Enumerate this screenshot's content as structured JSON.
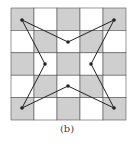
{
  "figure": {
    "caption": "(b)",
    "grid": {
      "rows": 5,
      "cols": 5,
      "x0": 11,
      "y0": 8,
      "cell_w": 23,
      "cell_h": 22.4,
      "dark_color": "#cfcfcf",
      "light_color": "#ffffff",
      "line_color": "#555555",
      "pattern": "checkerboard, top-left dark"
    },
    "polygon": {
      "shape": "4-pointed star",
      "stroke": "#222222",
      "vertices": [
        {
          "label": "top-left corner",
          "x": 22,
          "y": 20
        },
        {
          "label": "top inner",
          "x": 68,
          "y": 42
        },
        {
          "label": "top-right corner",
          "x": 114,
          "y": 20
        },
        {
          "label": "right inner",
          "x": 91,
          "y": 64
        },
        {
          "label": "bottom-right corner",
          "x": 114,
          "y": 108
        },
        {
          "label": "bottom inner",
          "x": 68,
          "y": 86
        },
        {
          "label": "bottom-left corner",
          "x": 22,
          "y": 108
        },
        {
          "label": "left inner",
          "x": 45,
          "y": 64
        }
      ]
    }
  }
}
